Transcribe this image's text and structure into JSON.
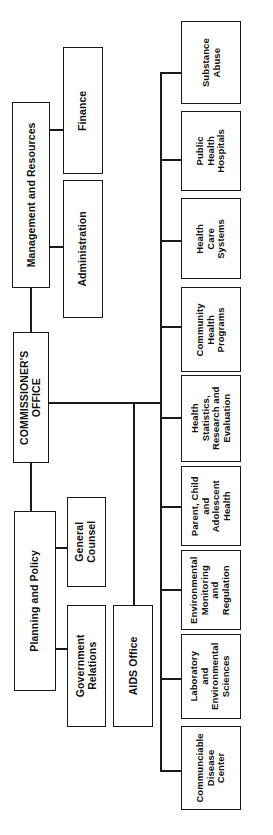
{
  "chart": {
    "type": "organization-chart",
    "orientation": "rotated-90-counterclockwise",
    "title_present": false,
    "line_color": "#1a1a1a",
    "box_fill": "#ffffff",
    "background": "#ffffff"
  },
  "nodes": {
    "commissioners_office": "COMMISSIONER'S\nOFFICE",
    "management_and_resources": "Management and Resources",
    "planning_and_policy": "Planning and Policy",
    "finance": "Finance",
    "administration": "Administration",
    "general_counsel": "General\nCounsel",
    "government_relations": "Government\nRelations",
    "aids_office": "AIDS Office",
    "substance_abuse": "Substance\nAbuse",
    "public_health_hospitals": "Public\nHealth\nHospitals",
    "health_care_systems": "Health\nCare\nSystems",
    "community_health_programs": "Community\nHealth\nPrograms",
    "health_statistics": "Health\nStatistics,\nResearch and\nEvaluation",
    "parent_child_adolescent_health": "Parent, Child\nand\nAdolescent\nHealth",
    "environmental_monitoring": "Environmental\nMonitoring\nand\nRegulation",
    "laboratory_environmental_sciences": "Laboratory\nand\nEnvironmental\nSciences",
    "communicable_disease_center": "Communciable\nDisease\nCenter"
  },
  "hierarchy": {
    "root": "commissioners_office",
    "top_branches": [
      {
        "parent": "management_and_resources",
        "children": [
          "finance",
          "administration"
        ]
      },
      {
        "parent": "planning_and_policy",
        "children": [
          "general_counsel",
          "government_relations"
        ]
      }
    ],
    "direct_children": [
      "aids_office"
    ],
    "operating_divisions": [
      "substance_abuse",
      "public_health_hospitals",
      "health_care_systems",
      "community_health_programs",
      "health_statistics",
      "parent_child_adolescent_health",
      "environmental_monitoring",
      "laboratory_environmental_sciences",
      "communicable_disease_center"
    ]
  }
}
